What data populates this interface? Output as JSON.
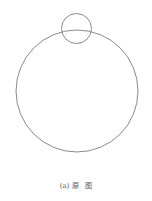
{
  "figure": {
    "stroke_color": "#8a8a8a",
    "large_circle": {
      "cx": 77,
      "cy": 91,
      "r": 61
    },
    "small_circle": {
      "cx": 76.5,
      "cy": 28.5,
      "r": 15
    }
  },
  "caption": {
    "text": "(a) 原   图"
  }
}
